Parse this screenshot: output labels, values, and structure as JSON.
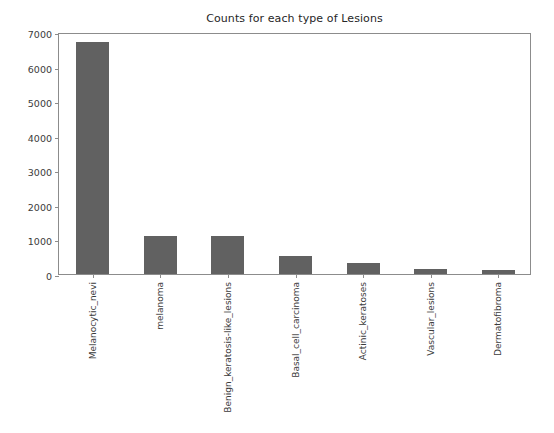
{
  "chart_data": {
    "type": "bar",
    "title": "Counts for each type of Lesions",
    "xlabel": "",
    "ylabel": "",
    "categories": [
      "Melanocytic_nevi",
      "melanoma",
      "Benign_keratosis-like_lesions",
      "Basal_cell_carcinoma",
      "Actinic_keratoses",
      "Vascular_lesions",
      "Dermatofibroma"
    ],
    "values": [
      6705,
      1113,
      1099,
      514,
      327,
      142,
      115
    ],
    "ylim": [
      0,
      7000
    ],
    "yticks": [
      0,
      1000,
      2000,
      3000,
      4000,
      5000,
      6000,
      7000
    ],
    "ytick_labels": [
      "0",
      "1000",
      "2000",
      "3000",
      "4000",
      "5000",
      "6000",
      "7000"
    ],
    "grid": false,
    "legend": false,
    "bar_color": "#616161",
    "background_color": "#ffffff",
    "axis_color": "#8c8c8c",
    "text_color": "#3b3b3b"
  }
}
